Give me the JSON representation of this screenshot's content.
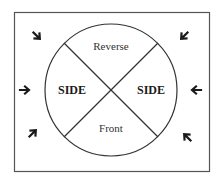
{
  "diagram": {
    "labels": {
      "top": "Reverse",
      "bottom": "Front",
      "left": "SIDE",
      "right": "SIDE"
    },
    "arrows": [
      {
        "position": "top-left",
        "direction": "down-right"
      },
      {
        "position": "top-right",
        "direction": "down-left"
      },
      {
        "position": "middle-left",
        "direction": "right"
      },
      {
        "position": "middle-right",
        "direction": "left"
      },
      {
        "position": "bottom-left",
        "direction": "up-right"
      },
      {
        "position": "bottom-right",
        "direction": "up-left"
      }
    ],
    "colors": {
      "stroke": "#333333",
      "background": "#ffffff"
    }
  }
}
